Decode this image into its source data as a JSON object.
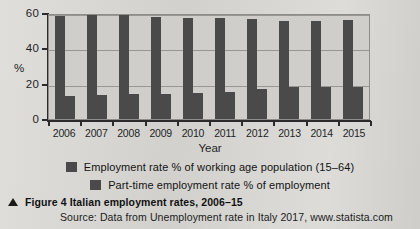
{
  "figure": {
    "caption_marker": "triangle-marker",
    "caption": "Figure 4 Italian employment rates, 2006–15",
    "source": "Source: Data from Unemployment rate in Italy 2017, www.statista.com"
  },
  "axes": {
    "y_title": "%",
    "x_title": "Year",
    "y_ticks": [
      "0",
      "20",
      "40",
      "60"
    ]
  },
  "legend": {
    "items": [
      {
        "label": "Employment rate % of working age population (15–64)",
        "color": "#4a4a4a",
        "swatch": "legend-swatch"
      },
      {
        "label": "Part-time employment rate % of employment",
        "color": "#4a4a4a",
        "swatch": "legend-swatch"
      }
    ]
  },
  "colors": {
    "page_background": "#d9d8d4",
    "plot_background": "#cfcecb",
    "bar": "#4a4a4a",
    "axis": "#2b2b2b",
    "gridline": "#8e8d89"
  },
  "chart_data": {
    "type": "bar",
    "title": "Figure 4 Italian employment rates, 2006–15",
    "xlabel": "Year",
    "ylabel": "%",
    "ylim": [
      0,
      60
    ],
    "yticks": [
      0,
      20,
      40,
      60
    ],
    "grid": true,
    "legend_position": "bottom",
    "categories": [
      "2006",
      "2007",
      "2008",
      "2009",
      "2010",
      "2011",
      "2012",
      "2013",
      "2014",
      "2015"
    ],
    "series": [
      {
        "name": "Employment rate % of working age population (15–64)",
        "color": "#4a4a4a",
        "values": [
          58.4,
          58.7,
          58.7,
          57.5,
          56.9,
          56.9,
          56.8,
          55.5,
          55.7,
          56.3
        ]
      },
      {
        "name": "Part-time employment rate % of employment",
        "color": "#4a4a4a",
        "values": [
          13.3,
          13.6,
          14.3,
          14.3,
          15.0,
          15.5,
          17.1,
          17.9,
          18.4,
          18.3
        ]
      }
    ]
  }
}
